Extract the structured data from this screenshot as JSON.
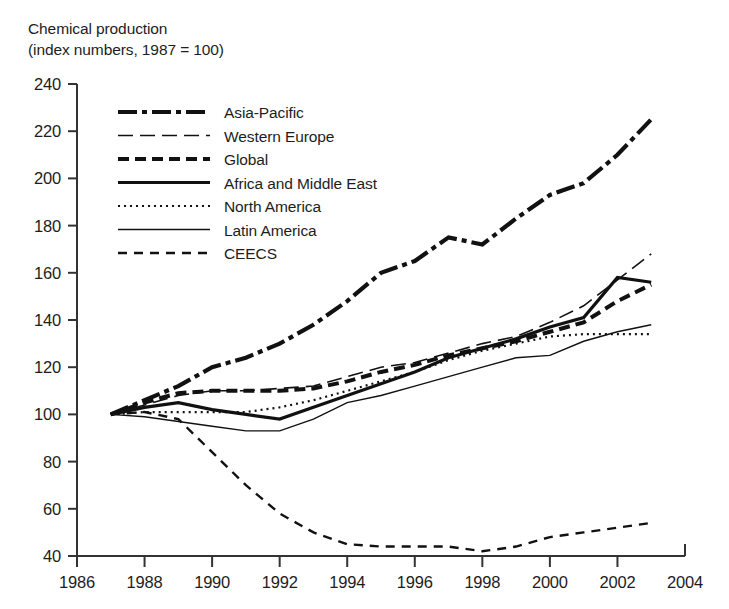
{
  "title": {
    "line1": "Chemical production",
    "line2": "(index numbers, 1987 = 100)"
  },
  "axes": {
    "y_ticks": [
      "240",
      "220",
      "200",
      "180",
      "160",
      "140",
      "120",
      "100",
      "80",
      "60",
      "40"
    ],
    "x_ticks": [
      "1986",
      "1988",
      "1990",
      "1992",
      "1994",
      "1996",
      "1998",
      "2000",
      "2002",
      "2004"
    ]
  },
  "legend": {
    "items": [
      {
        "label": "Asia-Pacific",
        "style": "dash-dot-thick"
      },
      {
        "label": "Western Europe",
        "style": "long-dash-thin"
      },
      {
        "label": "Global",
        "style": "dash-thick"
      },
      {
        "label": "Africa and Middle East",
        "style": "solid-thick"
      },
      {
        "label": "North America",
        "style": "dotted-thin"
      },
      {
        "label": "Latin America",
        "style": "solid-thin"
      },
      {
        "label": "CEECS",
        "style": "dash-medium"
      }
    ]
  },
  "chart_data": {
    "type": "line",
    "title": "Chemical production (index numbers, 1987 = 100)",
    "xlabel": "",
    "ylabel": "index numbers, 1987 = 100",
    "xlim": [
      1986,
      2004
    ],
    "ylim": [
      40,
      240
    ],
    "grid": false,
    "legend_position": "upper-left-inside",
    "x": [
      1987,
      1988,
      1989,
      1990,
      1991,
      1992,
      1993,
      1994,
      1995,
      1996,
      1997,
      1998,
      1999,
      2000,
      2001,
      2002,
      2003
    ],
    "series": [
      {
        "name": "Asia-Pacific",
        "style": "dash-dot-thick",
        "values": [
          100,
          106,
          112,
          120,
          124,
          130,
          138,
          148,
          160,
          165,
          175,
          172,
          183,
          193,
          198,
          210,
          225
        ]
      },
      {
        "name": "Western Europe",
        "style": "long-dash-thin",
        "values": [
          100,
          104,
          108,
          110,
          110,
          111,
          112,
          116,
          120,
          122,
          126,
          130,
          133,
          139,
          146,
          157,
          168
        ]
      },
      {
        "name": "Global",
        "style": "dash-thick",
        "values": [
          100,
          105,
          109,
          110,
          110,
          110,
          111,
          114,
          118,
          121,
          125,
          128,
          131,
          135,
          139,
          148,
          155
        ]
      },
      {
        "name": "Africa and Middle East",
        "style": "solid-thick",
        "values": [
          100,
          103,
          105,
          102,
          100,
          98,
          103,
          108,
          113,
          118,
          124,
          128,
          132,
          137,
          141,
          158,
          156
        ]
      },
      {
        "name": "North America",
        "style": "dotted-thin",
        "values": [
          100,
          101,
          101,
          101,
          101,
          103,
          106,
          110,
          114,
          118,
          123,
          127,
          130,
          133,
          134,
          134,
          134
        ]
      },
      {
        "name": "Latin America",
        "style": "solid-thin",
        "values": [
          100,
          99,
          97,
          95,
          93,
          93,
          98,
          105,
          108,
          112,
          116,
          120,
          124,
          125,
          131,
          135,
          138
        ]
      },
      {
        "name": "CEECS",
        "style": "dash-medium",
        "values": [
          100,
          101,
          98,
          84,
          70,
          58,
          50,
          45,
          44,
          44,
          44,
          42,
          44,
          48,
          50,
          52,
          54
        ]
      }
    ]
  }
}
